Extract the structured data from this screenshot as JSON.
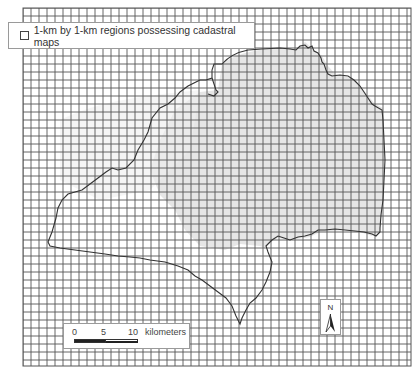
{
  "map": {
    "title_cutoff": "",
    "grid": {
      "x0": 23,
      "y0": 8,
      "x1": 411,
      "y1": 366,
      "cell_px": 8,
      "cell_label": "1 km x 1 km",
      "line_color": "#555555"
    },
    "shaded_region_color": "#e4e4e4",
    "boundary_color": "#333333"
  },
  "legend": {
    "label": "1-km by 1-km regions possessing cadastral maps",
    "swatch_icon": "empty-square"
  },
  "scale_bar": {
    "ticks": [
      "0",
      "5",
      "10"
    ],
    "unit": "kilometers"
  },
  "north_arrow": {
    "label": "N"
  }
}
